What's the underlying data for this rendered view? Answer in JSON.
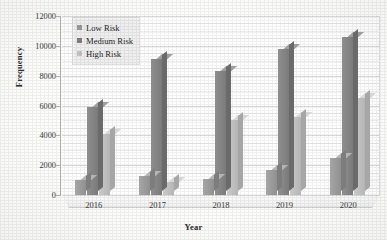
{
  "chart_data": {
    "type": "bar",
    "title": "",
    "subtitle": "",
    "xlabel": "Year",
    "ylabel": "Frequency",
    "categories": [
      "2016",
      "2017",
      "2018",
      "2019",
      "2020"
    ],
    "series": [
      {
        "name": "Low Risk",
        "color": "#9a9a9a",
        "values": [
          1000,
          1300,
          1100,
          1700,
          2500
        ]
      },
      {
        "name": "Medium Risk",
        "color": "#7f7f7f",
        "values": [
          5900,
          9100,
          8300,
          9800,
          10600
        ]
      },
      {
        "name": "High Risk",
        "color": "#c4c4c4",
        "values": [
          4100,
          900,
          5000,
          5200,
          6500
        ]
      }
    ],
    "ylim": [
      0,
      12000
    ],
    "ytick_step": 2000,
    "yticks": [
      "0",
      "2000",
      "4000",
      "6000",
      "8000",
      "10000",
      "12000"
    ],
    "grid": true,
    "minor_grid": true,
    "legend_position": "top-left",
    "style": "3d-clustered-column",
    "annotations": []
  }
}
